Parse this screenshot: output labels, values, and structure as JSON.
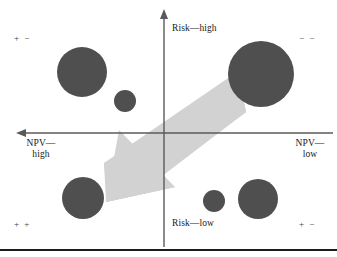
{
  "figure": {
    "title": "",
    "bottom_rule_color": "#1c1c1c"
  },
  "axes": {
    "vertical_top_label": "Risk—high",
    "vertical_bottom_label": "Risk—low",
    "horizontal_left_label": "NPV—\nhigh",
    "horizontal_right_label": "NPV—\nlow",
    "axis_color": "#5a5a5a",
    "origin_x": 164,
    "origin_y": 133
  },
  "quadrant_signs": {
    "top_left": "+ −",
    "top_right": "− −",
    "bottom_left": "+ +",
    "bottom_right": "+ −"
  },
  "chart_data": {
    "type": "scatter",
    "title": "",
    "xlabel": "NPV",
    "ylabel": "Risk",
    "x_axis": {
      "left_label": "NPV—high",
      "right_label": "NPV—low",
      "direction": "high to low (left to right)"
    },
    "y_axis": {
      "top_label": "Risk—high",
      "bottom_label": "Risk—low",
      "direction": "low to high (bottom to top)"
    },
    "grid": false,
    "legend": "none",
    "quadrant_labels": [
      "+ −",
      "− −",
      "+ +",
      "+ −"
    ],
    "bubble_color": "#4f4f4f",
    "arrow_color": "#d2d2d2",
    "arrow_direction": "from upper-right (low NPV, high risk) toward lower-left (high NPV, low risk)",
    "bubbles": [
      {
        "id": "bubble-1",
        "cx": 82,
        "cy": 72,
        "r": 25,
        "quadrant": "top-left"
      },
      {
        "id": "bubble-2",
        "cx": 125,
        "cy": 101,
        "r": 11,
        "quadrant": "top-left"
      },
      {
        "id": "bubble-3",
        "cx": 261,
        "cy": 74,
        "r": 33,
        "quadrant": "top-right"
      },
      {
        "id": "bubble-4",
        "cx": 83,
        "cy": 198,
        "r": 21,
        "quadrant": "bottom-left"
      },
      {
        "id": "bubble-5",
        "cx": 214,
        "cy": 201,
        "r": 11,
        "quadrant": "bottom-right"
      },
      {
        "id": "bubble-6",
        "cx": 258,
        "cy": 199,
        "r": 20,
        "quadrant": "bottom-right"
      }
    ]
  }
}
